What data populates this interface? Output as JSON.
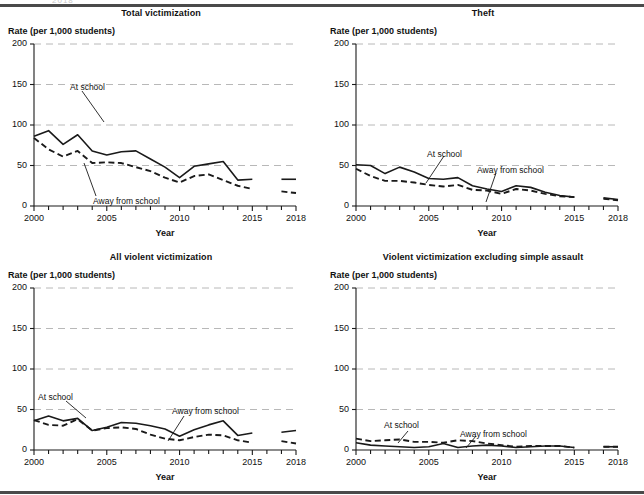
{
  "figure": {
    "ghost_text": "2018",
    "y_axis_label": "Rate (per 1,000 students)",
    "x_axis_label": "Year",
    "series_label_at_school": "At school",
    "series_label_away": "Away from school",
    "colors": {
      "line": "#1a1a1a",
      "gridline": "#b8b8b8",
      "axis": "#1a1a1a",
      "rule": "#4a4a4a"
    }
  },
  "chart_data": [
    {
      "type": "line",
      "title": "Total victimization",
      "xlabel": "Year",
      "ylabel": "Rate (per 1,000 students)",
      "ylim": [
        0,
        200
      ],
      "xlim": [
        2000,
        2018
      ],
      "yticks": [
        0,
        50,
        100,
        150,
        200
      ],
      "ytick_labels": [
        "0",
        "50",
        "100",
        "150",
        "200"
      ],
      "xticks": [
        2000,
        2005,
        2010,
        2015,
        2018
      ],
      "xtick_labels": [
        "2000",
        "2005",
        "2010",
        "2015",
        "2018"
      ],
      "grid": true,
      "legend_position": "inline-annotation",
      "series": [
        {
          "name": "At school",
          "style": "solid",
          "x": [
            2000,
            2001,
            2002,
            2003,
            2004,
            2005,
            2006,
            2007,
            2008,
            2009,
            2010,
            2011,
            2012,
            2013,
            2014,
            2015
          ],
          "values": [
            86,
            93,
            76,
            88,
            68,
            63,
            67,
            68,
            58,
            48,
            35,
            49,
            52,
            55,
            32,
            33
          ]
        },
        {
          "name": "At school",
          "style": "solid",
          "x": [
            2017,
            2018
          ],
          "values": [
            33,
            33
          ]
        },
        {
          "name": "Away from school",
          "style": "dashed",
          "x": [
            2000,
            2001,
            2002,
            2003,
            2004,
            2005,
            2006,
            2007,
            2008,
            2009,
            2010,
            2011,
            2012,
            2013,
            2014,
            2015
          ],
          "values": [
            84,
            70,
            61,
            68,
            53,
            54,
            53,
            48,
            43,
            35,
            29,
            37,
            39,
            32,
            25,
            21
          ]
        },
        {
          "name": "Away from school",
          "style": "dashed",
          "x": [
            2017,
            2018
          ],
          "values": [
            18,
            16
          ]
        }
      ]
    },
    {
      "type": "line",
      "title": "Theft",
      "xlabel": "Year",
      "ylabel": "Rate (per 1,000 students)",
      "ylim": [
        0,
        200
      ],
      "xlim": [
        2000,
        2018
      ],
      "yticks": [
        0,
        50,
        100,
        150,
        200
      ],
      "ytick_labels": [
        "0",
        "50",
        "100",
        "150",
        "200"
      ],
      "xticks": [
        2000,
        2005,
        2010,
        2015,
        2018
      ],
      "xtick_labels": [
        "2000",
        "2005",
        "2010",
        "2015",
        "2018"
      ],
      "grid": true,
      "legend_position": "inline-annotation",
      "series": [
        {
          "name": "At school",
          "style": "solid",
          "x": [
            2000,
            2001,
            2002,
            2003,
            2004,
            2005,
            2006,
            2007,
            2008,
            2009,
            2010,
            2011,
            2012,
            2013,
            2014,
            2015
          ],
          "values": [
            51,
            50,
            40,
            48,
            42,
            34,
            33,
            35,
            25,
            21,
            18,
            25,
            23,
            17,
            13,
            11
          ]
        },
        {
          "name": "At school",
          "style": "solid",
          "x": [
            2017,
            2018
          ],
          "values": [
            10,
            8
          ]
        },
        {
          "name": "Away from school",
          "style": "dashed",
          "x": [
            2000,
            2001,
            2002,
            2003,
            2004,
            2005,
            2006,
            2007,
            2008,
            2009,
            2010,
            2011,
            2012,
            2013,
            2014,
            2015
          ],
          "values": [
            46,
            37,
            31,
            31,
            29,
            26,
            24,
            26,
            20,
            19,
            15,
            21,
            19,
            15,
            12,
            11
          ]
        },
        {
          "name": "Away from school",
          "style": "dashed",
          "x": [
            2017,
            2018
          ],
          "values": [
            9,
            7
          ]
        }
      ]
    },
    {
      "type": "line",
      "title": "All violent victimization",
      "xlabel": "Year",
      "ylabel": "Rate (per 1,000 students)",
      "ylim": [
        0,
        200
      ],
      "xlim": [
        2000,
        2018
      ],
      "yticks": [
        0,
        50,
        100,
        150,
        200
      ],
      "ytick_labels": [
        "0",
        "50",
        "100",
        "150",
        "200"
      ],
      "xticks": [
        2000,
        2005,
        2010,
        2015,
        2018
      ],
      "xtick_labels": [
        "2000",
        "2005",
        "2010",
        "2015",
        "2018"
      ],
      "grid": true,
      "legend_position": "inline-annotation",
      "series": [
        {
          "name": "At school",
          "style": "solid",
          "x": [
            2000,
            2001,
            2002,
            2003,
            2004,
            2005,
            2006,
            2007,
            2008,
            2009,
            2010,
            2011,
            2012,
            2013,
            2014,
            2015
          ],
          "values": [
            36,
            42,
            36,
            39,
            24,
            28,
            34,
            33,
            30,
            26,
            17,
            25,
            31,
            36,
            18,
            21
          ]
        },
        {
          "name": "At school",
          "style": "solid",
          "x": [
            2017,
            2018
          ],
          "values": [
            22,
            24
          ]
        },
        {
          "name": "Away from school",
          "style": "dashed",
          "x": [
            2000,
            2001,
            2002,
            2003,
            2004,
            2005,
            2006,
            2007,
            2008,
            2009,
            2010,
            2011,
            2012,
            2013,
            2014,
            2015
          ],
          "values": [
            37,
            31,
            30,
            38,
            24,
            27,
            28,
            26,
            19,
            14,
            12,
            16,
            19,
            18,
            12,
            9
          ]
        },
        {
          "name": "Away from school",
          "style": "dashed",
          "x": [
            2017,
            2018
          ],
          "values": [
            11,
            8
          ]
        }
      ]
    },
    {
      "type": "line",
      "title": "Violent victimization excluding simple assault",
      "xlabel": "Year",
      "ylabel": "Rate (per 1,000 students)",
      "ylim": [
        0,
        200
      ],
      "xlim": [
        2000,
        2018
      ],
      "yticks": [
        0,
        50,
        100,
        150,
        200
      ],
      "ytick_labels": [
        "0",
        "50",
        "100",
        "150",
        "200"
      ],
      "xticks": [
        2000,
        2005,
        2010,
        2015,
        2018
      ],
      "xtick_labels": [
        "2000",
        "2005",
        "2010",
        "2015",
        "2018"
      ],
      "grid": true,
      "legend_position": "inline-annotation",
      "series": [
        {
          "name": "At school",
          "style": "solid",
          "x": [
            2000,
            2001,
            2002,
            2003,
            2004,
            2005,
            2006,
            2007,
            2008,
            2009,
            2010,
            2011,
            2012,
            2013,
            2014,
            2015
          ],
          "values": [
            9,
            6,
            5,
            4,
            3,
            4,
            8,
            3,
            5,
            6,
            5,
            3,
            4,
            5,
            5,
            3
          ]
        },
        {
          "name": "At school",
          "style": "solid",
          "x": [
            2017,
            2018
          ],
          "values": [
            4,
            4
          ]
        },
        {
          "name": "Away from school",
          "style": "dashed",
          "x": [
            2000,
            2001,
            2002,
            2003,
            2004,
            2005,
            2006,
            2007,
            2008,
            2009,
            2010,
            2011,
            2012,
            2013,
            2014,
            2015
          ],
          "values": [
            14,
            11,
            12,
            13,
            10,
            10,
            9,
            12,
            11,
            8,
            6,
            4,
            5,
            5,
            5,
            3
          ]
        },
        {
          "name": "Away from school",
          "style": "dashed",
          "x": [
            2017,
            2018
          ],
          "values": [
            4,
            4
          ]
        }
      ]
    }
  ],
  "panels": [
    {
      "id": "total-victimization",
      "annotations": {
        "at_school": {
          "text": "At school",
          "x": 70,
          "y": 74
        },
        "away": {
          "text": "Away from school",
          "x": 93,
          "y": 188
        }
      }
    },
    {
      "id": "theft",
      "annotations": {
        "at_school": {
          "text": "At school",
          "x": 105,
          "y": 141
        },
        "away": {
          "text": "Away from school",
          "x": 155,
          "y": 157
        }
      }
    },
    {
      "id": "all-violent-victimization",
      "annotations": {
        "at_school": {
          "text": "At school",
          "x": 38,
          "y": 140
        },
        "away": {
          "text": "Away from school",
          "x": 172,
          "y": 154
        }
      }
    },
    {
      "id": "violent-excluding-simple-assault",
      "annotations": {
        "at_school": {
          "text": "At school",
          "x": 62,
          "y": 168
        },
        "away": {
          "text": "Away from school",
          "x": 138,
          "y": 177
        }
      }
    }
  ]
}
